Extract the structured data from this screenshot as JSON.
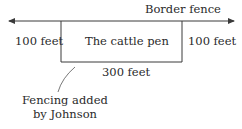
{
  "diagram": {
    "border_fence_label": "Border fence",
    "pen_label": "The cattle pen",
    "left_side_label": "100 feet",
    "right_side_label": "100 feet",
    "bottom_side_label": "300 feet",
    "callout_line1": "Fencing added",
    "callout_line2": "by Johnson",
    "line_color": "#3a3a3a"
  }
}
